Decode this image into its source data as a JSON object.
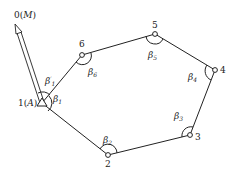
{
  "diagram": {
    "orientation": {
      "label_num": "0",
      "label_name": "M"
    },
    "start": {
      "label_num": "1",
      "label_name": "A"
    },
    "points": [
      {
        "id": "2",
        "label": "2"
      },
      {
        "id": "3",
        "label": "3"
      },
      {
        "id": "4",
        "label": "4"
      },
      {
        "id": "5",
        "label": "5"
      },
      {
        "id": "6",
        "label": "6"
      }
    ],
    "angles": [
      {
        "id": "b1",
        "base": "β",
        "sub": "1",
        "prime": ""
      },
      {
        "id": "b1p",
        "base": "β",
        "sub": "1",
        "prime": "′"
      },
      {
        "id": "b2",
        "base": "β",
        "sub": "2",
        "prime": ""
      },
      {
        "id": "b3",
        "base": "β",
        "sub": "3",
        "prime": ""
      },
      {
        "id": "b4",
        "base": "β",
        "sub": "4",
        "prime": ""
      },
      {
        "id": "b5",
        "base": "β",
        "sub": "5",
        "prime": ""
      },
      {
        "id": "b6",
        "base": "β",
        "sub": "6",
        "prime": ""
      }
    ],
    "colors": {
      "line": "#222222",
      "background": "#ffffff"
    }
  }
}
